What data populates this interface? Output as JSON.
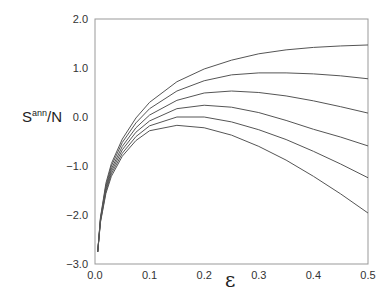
{
  "chart_data": {
    "type": "line",
    "title": "",
    "xlabel": "ε",
    "ylabel_main": "S",
    "ylabel_sup": "ann",
    "ylabel_tail": "/N",
    "xlim": [
      0.0,
      0.5
    ],
    "ylim": [
      -3.0,
      2.0
    ],
    "xticks": [
      "0.0",
      "0.1",
      "0.2",
      "0.3",
      "0.4",
      "0.5"
    ],
    "yticks": [
      "2.0",
      "1.0",
      "0.0",
      "−1.0",
      "−2.0",
      "−3.0"
    ],
    "grid": false,
    "legend": null,
    "x": [
      0.005,
      0.01,
      0.02,
      0.03,
      0.05,
      0.075,
      0.1,
      0.15,
      0.2,
      0.25,
      0.3,
      0.35,
      0.4,
      0.45,
      0.5
    ],
    "series": [
      {
        "name": "curve-1",
        "values": [
          -2.75,
          -2.05,
          -1.35,
          -0.95,
          -0.45,
          -0.02,
          0.3,
          0.72,
          0.98,
          1.16,
          1.29,
          1.37,
          1.42,
          1.45,
          1.47
        ]
      },
      {
        "name": "curve-2",
        "values": [
          -2.75,
          -2.07,
          -1.4,
          -1.0,
          -0.52,
          -0.12,
          0.17,
          0.53,
          0.74,
          0.86,
          0.9,
          0.9,
          0.88,
          0.84,
          0.78
        ]
      },
      {
        "name": "curve-3",
        "values": [
          -2.75,
          -2.09,
          -1.44,
          -1.06,
          -0.6,
          -0.22,
          0.04,
          0.34,
          0.49,
          0.53,
          0.5,
          0.43,
          0.33,
          0.21,
          0.08
        ]
      },
      {
        "name": "curve-4",
        "values": [
          -2.75,
          -2.11,
          -1.48,
          -1.11,
          -0.67,
          -0.31,
          -0.08,
          0.17,
          0.24,
          0.2,
          0.09,
          -0.07,
          -0.25,
          -0.41,
          -0.59
        ]
      },
      {
        "name": "curve-5",
        "values": [
          -2.75,
          -2.13,
          -1.52,
          -1.16,
          -0.74,
          -0.4,
          -0.18,
          0.0,
          0.0,
          -0.1,
          -0.26,
          -0.46,
          -0.7,
          -0.96,
          -1.24
        ]
      },
      {
        "name": "curve-6",
        "values": [
          -2.75,
          -2.15,
          -1.56,
          -1.21,
          -0.8,
          -0.48,
          -0.28,
          -0.17,
          -0.22,
          -0.37,
          -0.6,
          -0.88,
          -1.21,
          -1.57,
          -1.96
        ]
      }
    ],
    "colors": {
      "line": "#555555",
      "axis": "#888888"
    }
  }
}
